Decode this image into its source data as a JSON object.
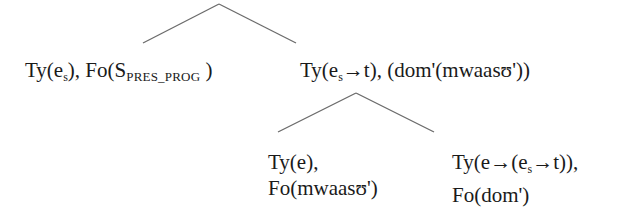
{
  "tree": {
    "edges": [
      {
        "from": [
          219,
          4
        ],
        "to": [
          143,
          43
        ]
      },
      {
        "from": [
          219,
          4
        ],
        "to": [
          296,
          43
        ]
      },
      {
        "from": [
          356,
          93
        ],
        "to": [
          278,
          132
        ]
      },
      {
        "from": [
          356,
          93
        ],
        "to": [
          434,
          132
        ]
      }
    ],
    "edge_color": "#6b6b6b",
    "nodes": {
      "left": {
        "ty_prefix": "Ty(e",
        "ty_sub": "s",
        "ty_suffix": "), Fo(S",
        "fo_sub": "PRES_PROG",
        "fo_suffix": " )"
      },
      "right": {
        "ty_prefix": "Ty(e",
        "ty_sub": "s",
        "ty_suffix": "→t), (dom'(mwaasʊ'))"
      },
      "right_left": {
        "line1": "Ty(e),",
        "line2": "Fo(mwaasʊ')"
      },
      "right_right": {
        "line1_prefix": "Ty(e→(e",
        "line1_sub": "s",
        "line1_suffix": "→t)),",
        "line2": "Fo(dom')"
      }
    }
  }
}
